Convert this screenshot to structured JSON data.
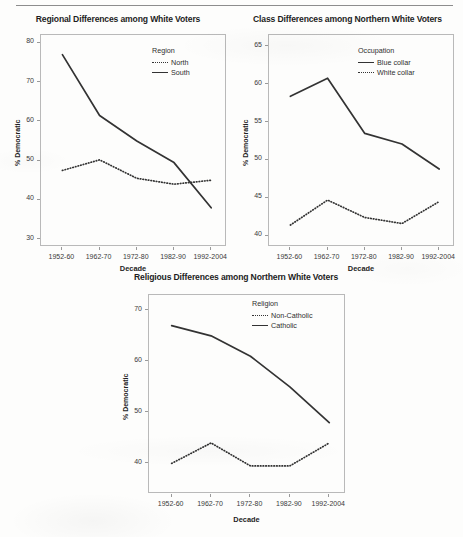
{
  "page": {
    "background_color": "#fdfdfc",
    "rule_color": "#8d8d8d"
  },
  "chart_data": [
    {
      "type": "line",
      "title": "Regional Differences among White Voters",
      "xlabel": "Decade",
      "ylabel": "% Democratic",
      "categories": [
        "1952-60",
        "1962-70",
        "1972-80",
        "1982-90",
        "1992-2004"
      ],
      "ylim": [
        28,
        82
      ],
      "yticks": [
        30,
        40,
        50,
        60,
        70,
        80
      ],
      "grid": false,
      "legend_title": "Region",
      "legend_position": "top-right inside",
      "series": [
        {
          "name": "North",
          "style": "dotted",
          "color": "#333333",
          "values": [
            47.5,
            50.2,
            45.5,
            44.0,
            45.0
          ]
        },
        {
          "name": "South",
          "style": "solid",
          "color": "#333333",
          "values": [
            77.0,
            61.5,
            55.0,
            49.5,
            38.0
          ]
        }
      ]
    },
    {
      "type": "line",
      "title": "Class Differences among Northern White Voters",
      "xlabel": "Decade",
      "ylabel": "% Democratic",
      "categories": [
        "1952-60",
        "1962-70",
        "1972-80",
        "1982-90",
        "1992-2004"
      ],
      "ylim": [
        38.5,
        66.5
      ],
      "yticks": [
        40,
        45,
        50,
        55,
        60,
        65
      ],
      "grid": false,
      "legend_title": "Occupation",
      "legend_position": "top-right inside",
      "series": [
        {
          "name": "Blue collar",
          "style": "solid",
          "color": "#333333",
          "values": [
            58.4,
            60.8,
            53.5,
            52.1,
            48.8
          ]
        },
        {
          "name": "White collar",
          "style": "dotted",
          "color": "#333333",
          "values": [
            41.4,
            44.7,
            42.4,
            41.6,
            44.5
          ]
        }
      ]
    },
    {
      "type": "line",
      "title": "Religious Differences among Northern White Voters",
      "xlabel": "Decade",
      "ylabel": "% Democratic",
      "categories": [
        "1952-60",
        "1962-70",
        "1972-80",
        "1982-90",
        "1992-2004"
      ],
      "ylim": [
        34,
        73
      ],
      "yticks": [
        40,
        50,
        60,
        70
      ],
      "grid": false,
      "legend_title": "Religion",
      "legend_position": "top-right inside",
      "series": [
        {
          "name": "Non-Catholic",
          "style": "dotted",
          "color": "#333333",
          "values": [
            40.0,
            44.0,
            39.5,
            39.5,
            44.0
          ]
        },
        {
          "name": "Catholic",
          "style": "solid",
          "color": "#333333",
          "values": [
            67.0,
            65.0,
            61.0,
            55.0,
            48.0
          ]
        }
      ]
    }
  ]
}
